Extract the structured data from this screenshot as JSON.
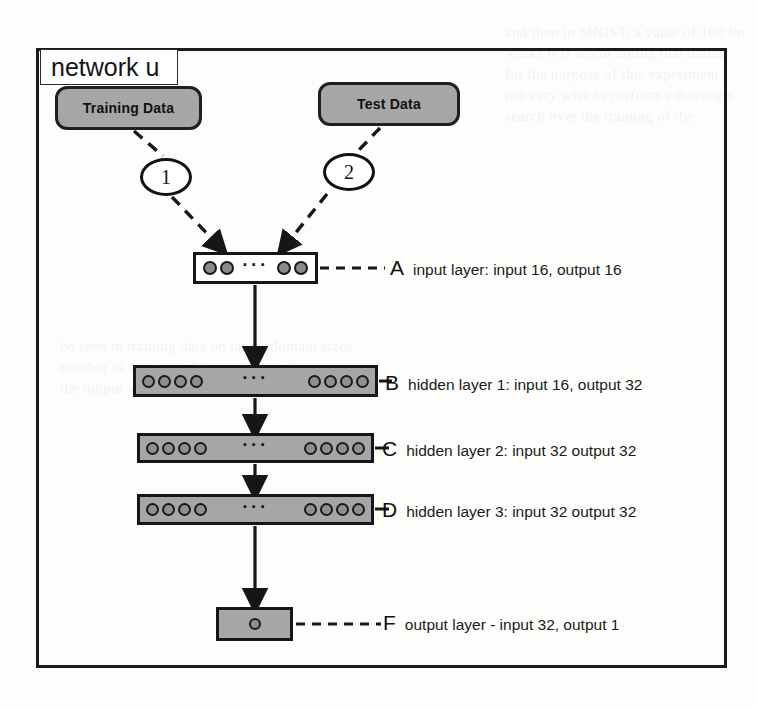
{
  "frame": {
    "title": "network u"
  },
  "sources": [
    {
      "id": "training",
      "label": "Training Data"
    },
    {
      "id": "test",
      "label": "Test Data"
    }
  ],
  "callouts": [
    {
      "id": "callout-1",
      "label": "1"
    },
    {
      "id": "callout-2",
      "label": "2"
    }
  ],
  "layers": [
    {
      "key": "A",
      "letter": "A",
      "description": "input layer: input 16, output 16",
      "nodes_left": 2,
      "nodes_right": 2,
      "ellipsis": "···"
    },
    {
      "key": "B",
      "letter": "B",
      "description": "hidden layer 1: input 16, output 32",
      "nodes_left": 4,
      "nodes_right": 4,
      "ellipsis": "···"
    },
    {
      "key": "C",
      "letter": "C",
      "description": "hidden layer 2: input 32 output 32",
      "nodes_left": 4,
      "nodes_right": 4,
      "ellipsis": "···"
    },
    {
      "key": "D",
      "letter": "D",
      "description": "hidden layer 3: input 32 output 32",
      "nodes_left": 4,
      "nodes_right": 4,
      "ellipsis": "···"
    },
    {
      "key": "F",
      "letter": "F",
      "description": "output layer - input 32, output 1",
      "nodes_left": 1,
      "nodes_right": 0,
      "ellipsis": ""
    }
  ],
  "colors": {
    "box_fill": "#a6a6a6",
    "stroke": "#161616",
    "page_background": "#fdfdfc",
    "node_fill": "#8f8f8f"
  },
  "background_text": {
    "top_right": "and then in MNIST, a value of 100 for",
    "top_right_2": "works it is worth noting that tuning",
    "top_right_3": "for the purpose of this experiment",
    "top_right_4": "not very wise to perform a thorough",
    "top_right_5": "search over the training of the",
    "mid_right": "be seen in training data on larger domain sizes",
    "mid_right_2": "number of epochs, while on the smaller",
    "mid_right_3": "the output value will not diverge"
  }
}
